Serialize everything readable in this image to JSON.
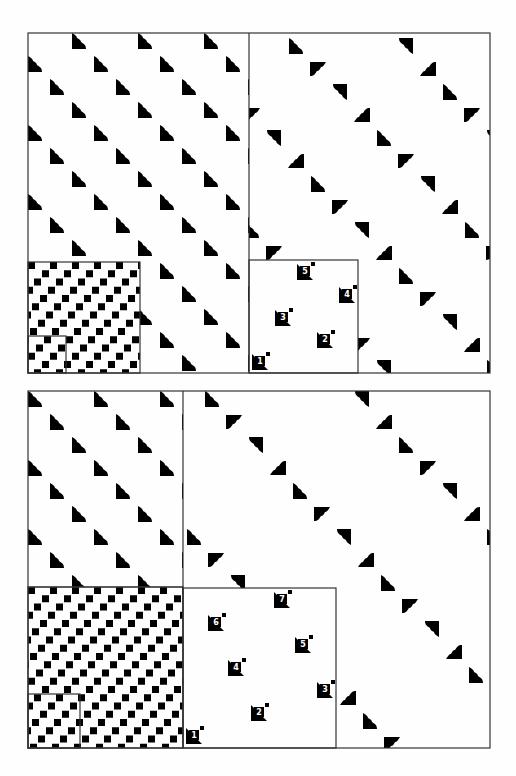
{
  "figure_top": {
    "outer_box": {
      "x": 28,
      "y": 33,
      "w": 462,
      "h": 340
    },
    "divider_x": 249,
    "left_region": {
      "motif": "quarter-notch-triangle",
      "rotation": 0,
      "cell": {
        "dx": 66,
        "dy": 68
      },
      "row_offset": {
        "dx": 22,
        "dy": 23
      }
    },
    "right_region": {
      "motif": "quarter-notch-triangle",
      "rotations": [
        0,
        90,
        180,
        270
      ],
      "cell": {
        "dx": 110,
        "dy": 114
      }
    },
    "squares_box": {
      "x": 28,
      "y": 262,
      "w": 112,
      "h": 111
    },
    "squares_inner_box": {
      "x": 28,
      "y": 336,
      "w": 38,
      "h": 37
    },
    "numbered_box": {
      "x": 249,
      "y": 260,
      "w": 109,
      "h": 113,
      "markers": [
        {
          "label": "1",
          "x": 260,
          "y": 362
        },
        {
          "label": "2",
          "x": 325,
          "y": 340
        },
        {
          "label": "3",
          "x": 283,
          "y": 318
        },
        {
          "label": "4",
          "x": 347,
          "y": 295
        },
        {
          "label": "5",
          "x": 305,
          "y": 272
        }
      ]
    }
  },
  "figure_bottom": {
    "outer_box": {
      "x": 28,
      "y": 391,
      "w": 462,
      "h": 357
    },
    "divider_x": 183,
    "left_divider_y": 587,
    "squares_box": {
      "x": 28,
      "y": 587,
      "w": 155,
      "h": 161
    },
    "squares_inner_box": {
      "x": 28,
      "y": 694,
      "w": 52,
      "h": 54
    },
    "numbered_box": {
      "x": 183,
      "y": 588,
      "w": 153,
      "h": 160,
      "markers": [
        {
          "label": "1",
          "x": 194,
          "y": 736
        },
        {
          "label": "2",
          "x": 259,
          "y": 713
        },
        {
          "label": "3",
          "x": 325,
          "y": 690
        },
        {
          "label": "4",
          "x": 236,
          "y": 668
        },
        {
          "label": "5",
          "x": 303,
          "y": 645
        },
        {
          "label": "6",
          "x": 216,
          "y": 623
        },
        {
          "label": "7",
          "x": 282,
          "y": 600
        }
      ]
    }
  },
  "colors": {
    "ink": "#000000",
    "paper": "#fefefe",
    "frame": "#333333"
  }
}
